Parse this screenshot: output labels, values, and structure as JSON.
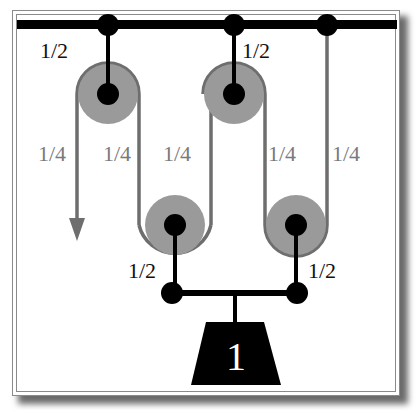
{
  "diagram": {
    "type": "pulley-system",
    "colors": {
      "rope": "#6e6e6e",
      "pulley": "#9a9a9a",
      "rigid": "#000000",
      "label_tension_rope": "#7a7a7a",
      "label_tension_rod": "#111111",
      "weight_fill": "#000000",
      "weight_text": "#ffffff"
    },
    "labels": {
      "top_left_rod": "1/2",
      "top_middle_rod": "1/2",
      "rope_1": "1/4",
      "rope_2": "1/4",
      "rope_3": "1/4",
      "rope_4": "1/4",
      "rope_5": "1/4",
      "bottom_left_rod": "1/2",
      "bottom_right_rod": "1/2",
      "weight": "1"
    },
    "components": {
      "ceiling": "ceiling-bar",
      "fixed_pulleys": 2,
      "movable_pulleys": 2,
      "anchors": 3,
      "pull_arrow": "down"
    }
  }
}
